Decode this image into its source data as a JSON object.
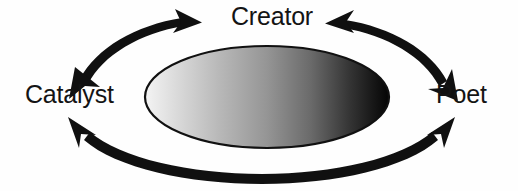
{
  "diagram": {
    "background_color": "#fefefe",
    "nodes": [
      {
        "id": "creator",
        "label": "Creator",
        "position": "top"
      },
      {
        "id": "catalyst",
        "label": "Catalyst",
        "position": "left"
      },
      {
        "id": "poet",
        "label": "Poet",
        "position": "right"
      }
    ],
    "center_shape": {
      "name": "central-ellipse",
      "type": "ellipse",
      "cx": 267,
      "cy": 97,
      "rx": 122,
      "ry": 51,
      "stroke_color": "#111111",
      "gradient_from": "#f2f2f2",
      "gradient_to": "#050505",
      "gradient_direction": "left-to-right"
    },
    "connectors": [
      {
        "id": "creator-catalyst",
        "from": "Creator",
        "to": "Catalyst",
        "style": "curved-double-arrow",
        "color": "#101010"
      },
      {
        "id": "creator-poet",
        "from": "Creator",
        "to": "Poet",
        "style": "curved-double-arrow",
        "color": "#101010"
      },
      {
        "id": "catalyst-poet",
        "from": "Catalyst",
        "to": "Poet",
        "style": "curved-double-arrow",
        "color": "#101010"
      }
    ]
  }
}
